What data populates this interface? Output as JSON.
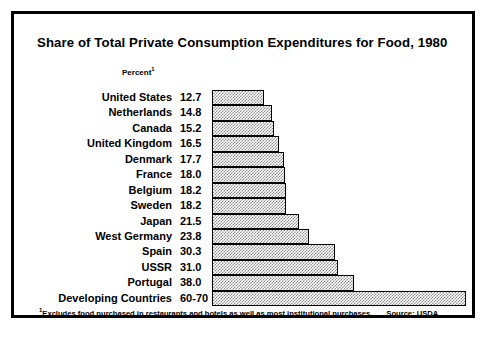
{
  "title": "Share of Total Private Consumption Expenditures for Food, 1980",
  "axis_header": "Percent",
  "axis_header_superscript": "1",
  "footnote": {
    "marker": "1",
    "text": "Excludes food purchased in restaurants and hotels as well as most  institutional purchases.",
    "source": "Source: USDA"
  },
  "colors": {
    "frame": "#000000",
    "bar_fill": "#8f8f8f",
    "bar_border": "#000000",
    "background": "#ffffff",
    "text": "#000000"
  },
  "chart_data": {
    "type": "bar",
    "orientation": "horizontal",
    "title": "Share of Total Private Consumption Expenditures for Food, 1980",
    "xlabel": "Percent",
    "ylabel": "",
    "xlim": [
      0,
      70
    ],
    "grid": false,
    "legend": false,
    "categories": [
      "United States",
      "Netherlands",
      "Canada",
      "United Kingdom",
      "Denmark",
      "France",
      "Belgium",
      "Sweden",
      "Japan",
      "West Germany",
      "Spain",
      "USSR",
      "Portugal",
      "Developing Countries"
    ],
    "values": [
      12.7,
      14.8,
      15.2,
      16.5,
      17.7,
      18.0,
      18.2,
      18.2,
      21.5,
      23.8,
      30.3,
      31.0,
      38.0,
      65
    ],
    "value_labels": [
      "12.7",
      "14.8",
      "15.2",
      "16.5",
      "17.7",
      "18.0",
      "18.2",
      "18.2",
      "21.5",
      "23.8",
      "30.3",
      "31.0",
      "38.0",
      "60-70"
    ]
  },
  "rows": [
    {
      "label": "United States",
      "value": "12.7",
      "bar": 12.7
    },
    {
      "label": "Netherlands",
      "value": "14.8",
      "bar": 14.8
    },
    {
      "label": "Canada",
      "value": "15.2",
      "bar": 15.2
    },
    {
      "label": "United Kingdom",
      "value": "16.5",
      "bar": 16.5
    },
    {
      "label": "Denmark",
      "value": "17.7",
      "bar": 17.7
    },
    {
      "label": "France",
      "value": "18.0",
      "bar": 18.0
    },
    {
      "label": "Belgium",
      "value": "18.2",
      "bar": 18.2
    },
    {
      "label": "Sweden",
      "value": "18.2",
      "bar": 18.2
    },
    {
      "label": "Japan",
      "value": "21.5",
      "bar": 21.5
    },
    {
      "label": "West Germany",
      "value": "23.8",
      "bar": 23.8
    },
    {
      "label": "Spain",
      "value": "30.3",
      "bar": 30.3
    },
    {
      "label": "USSR",
      "value": "31.0",
      "bar": 31.0
    },
    {
      "label": "Portugal",
      "value": "38.0",
      "bar": 35.0
    },
    {
      "label": "Developing Countries",
      "value": "60-70",
      "bar": 62.5
    }
  ]
}
